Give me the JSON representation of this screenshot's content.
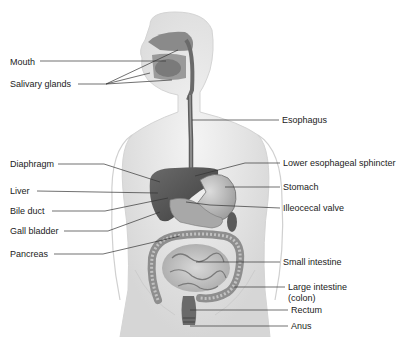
{
  "diagram": {
    "left_labels": [
      {
        "text": "Mouth",
        "x": 10,
        "y": 57
      },
      {
        "text": "Salivary glands",
        "x": 10,
        "y": 79
      },
      {
        "text": "Diaphragm",
        "x": 10,
        "y": 160
      },
      {
        "text": "Liver",
        "x": 10,
        "y": 187
      },
      {
        "text": "Bile duct",
        "x": 10,
        "y": 207
      },
      {
        "text": "Gall bladder",
        "x": 10,
        "y": 227
      },
      {
        "text": "Pancreas",
        "x": 10,
        "y": 250
      }
    ],
    "right_labels": [
      {
        "text": "Esophagus",
        "x": 282,
        "y": 117
      },
      {
        "text": "Lower esophageal sphincter",
        "x": 283,
        "y": 160
      },
      {
        "text": "Stomach",
        "x": 283,
        "y": 184
      },
      {
        "text": "Illeocecal valve",
        "x": 283,
        "y": 205
      },
      {
        "text": "Small intestine",
        "x": 283,
        "y": 258
      },
      {
        "text": "Large intestine",
        "x": 288,
        "y": 283
      },
      {
        "text": "(colon)",
        "x": 288,
        "y": 294
      },
      {
        "text": "Rectum",
        "x": 291,
        "y": 306
      },
      {
        "text": "Anus",
        "x": 291,
        "y": 322
      }
    ],
    "colors": {
      "label_text": "#222222",
      "leader_line": "#333333",
      "body_fill": "#e9e9e9",
      "body_outline": "#cfcfcf",
      "organ_dark": "#5a5a5a",
      "organ_mid": "#8c8c8c",
      "organ_light": "#c4c4c4"
    }
  }
}
